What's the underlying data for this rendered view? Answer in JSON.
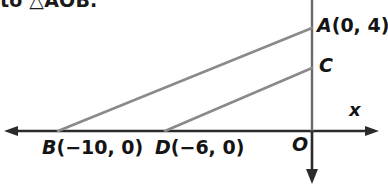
{
  "figure": {
    "kind": "coordinate-geometry-diagram",
    "prompt_text": "to △AOB.",
    "colors": {
      "background": "#ffffff",
      "axis": "#2b2b2b",
      "ray": "#8a8a8a",
      "text": "#141414"
    },
    "axes": {
      "x_axis": {
        "label": "x",
        "from": [
          5,
          131
        ],
        "to": [
          378,
          131
        ],
        "arrows": "both"
      },
      "y_axis": {
        "label": "",
        "from": [
          312,
          0
        ],
        "to": [
          312,
          182
        ],
        "arrows": "down"
      },
      "origin": {
        "label": "O",
        "at": [
          312,
          131
        ]
      }
    },
    "points": [
      {
        "name": "A",
        "label": "A(0, 4)",
        "letter": "A",
        "coords": "(0, 4)",
        "px": [
          312,
          28
        ]
      },
      {
        "name": "C",
        "label": "C",
        "letter": "C",
        "coords": "",
        "px": [
          312,
          68
        ]
      },
      {
        "name": "B",
        "label": "B(−10, 0)",
        "letter": "B",
        "coords": "(−10, 0)",
        "px": [
          58,
          131
        ]
      },
      {
        "name": "D",
        "label": "D(−6, 0)",
        "letter": "D",
        "coords": "(−6, 0)",
        "px": [
          165,
          131
        ]
      },
      {
        "name": "O",
        "label": "O",
        "letter": "O",
        "coords": "",
        "px": [
          312,
          131
        ]
      }
    ],
    "segments": [
      {
        "name": "BA",
        "from": "B",
        "to": "A",
        "x1": 58,
        "y1": 131,
        "x2": 312,
        "y2": 28
      },
      {
        "name": "DC",
        "from": "D",
        "to": "C",
        "x1": 165,
        "y1": 131,
        "x2": 312,
        "y2": 68
      }
    ],
    "labels": {
      "A": "A(0, 4)",
      "A_letter": "A",
      "A_coords": "(0, 4)",
      "C": "C",
      "B_letter": "B",
      "B_coords": "(−10, 0)",
      "D_letter": "D",
      "D_coords": "(−6, 0)",
      "O": "O",
      "x_axis": "x"
    }
  }
}
